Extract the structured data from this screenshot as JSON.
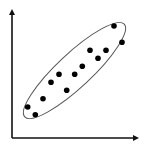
{
  "diagram": {
    "type": "scatter-cluster",
    "colors": {
      "axis": "#111111",
      "point": "#000000",
      "ellipse": "#555555",
      "background": "#ffffff"
    }
  },
  "chart_data": {
    "type": "scatter",
    "title": "",
    "xlabel": "",
    "ylabel": "",
    "grid": false,
    "legend": null,
    "points_px": [
      {
        "x": 27.7,
        "y": 107.0
      },
      {
        "x": 35.3,
        "y": 114.7
      },
      {
        "x": 43.0,
        "y": 98.7
      },
      {
        "x": 51.0,
        "y": 82.3
      },
      {
        "x": 59.0,
        "y": 74.3
      },
      {
        "x": 66.7,
        "y": 90.3
      },
      {
        "x": 74.7,
        "y": 74.3
      },
      {
        "x": 82.3,
        "y": 66.3
      },
      {
        "x": 90.0,
        "y": 50.3
      },
      {
        "x": 98.0,
        "y": 58.3
      },
      {
        "x": 106.0,
        "y": 50.3
      },
      {
        "x": 114.0,
        "y": 26.0
      },
      {
        "x": 122.0,
        "y": 42.3
      }
    ],
    "enclosure": {
      "shape": "ellipse",
      "cx": 74.5,
      "cy": 70.5,
      "rx": 68,
      "ry": 17,
      "rotation_deg": -43
    },
    "axes": {
      "x": {
        "x1": 12,
        "y1": 138,
        "x2": 137,
        "y2": 138,
        "arrow": true
      },
      "y": {
        "x1": 12,
        "y1": 138,
        "x2": 12,
        "y2": 11,
        "arrow": true
      }
    }
  }
}
